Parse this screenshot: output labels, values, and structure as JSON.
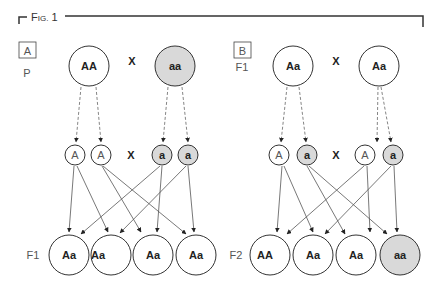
{
  "figure": {
    "title_prefix": "F",
    "title_small": "IG.",
    "title_number": "1",
    "colors": {
      "dominant_fill": "#ffffff",
      "recessive_fill": "#d9d9d9",
      "stroke": "#333333"
    }
  },
  "panel_a": {
    "label": "A",
    "parent_gen_label": "P",
    "cross_symbol": "X",
    "parents": [
      {
        "genotype": "AA",
        "fill": "dominant"
      },
      {
        "genotype": "aa",
        "fill": "recessive"
      }
    ],
    "gametes": [
      {
        "allele": "A",
        "fill": "dominant"
      },
      {
        "allele": "A",
        "fill": "dominant"
      },
      {
        "allele": "a",
        "fill": "recessive"
      },
      {
        "allele": "a",
        "fill": "recessive"
      }
    ],
    "offspring_gen_label": "F1",
    "offspring": [
      {
        "genotype": "Aa",
        "fill": "dominant"
      },
      {
        "genotype": "Aa",
        "fill": "dominant"
      },
      {
        "genotype": "Aa",
        "fill": "dominant"
      },
      {
        "genotype": "Aa",
        "fill": "dominant"
      }
    ]
  },
  "panel_b": {
    "label": "B",
    "parent_gen_label": "F1",
    "cross_symbol": "X",
    "parents": [
      {
        "genotype": "Aa",
        "fill": "dominant"
      },
      {
        "genotype": "Aa",
        "fill": "dominant"
      }
    ],
    "gametes": [
      {
        "allele": "A",
        "fill": "dominant"
      },
      {
        "allele": "a",
        "fill": "recessive"
      },
      {
        "allele": "A",
        "fill": "dominant"
      },
      {
        "allele": "a",
        "fill": "recessive"
      }
    ],
    "offspring_gen_label": "F2",
    "offspring": [
      {
        "genotype": "AA",
        "fill": "dominant"
      },
      {
        "genotype": "Aa",
        "fill": "dominant"
      },
      {
        "genotype": "Aa",
        "fill": "dominant"
      },
      {
        "genotype": "aa",
        "fill": "recessive"
      }
    ]
  }
}
